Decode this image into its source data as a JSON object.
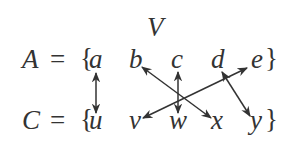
{
  "diagram": {
    "label_top": "V",
    "row_a": {
      "name": "A",
      "equals": "=",
      "open_brace": "{",
      "elements": [
        "a",
        "b",
        "c",
        "d",
        "e"
      ],
      "close_brace": "}"
    },
    "row_c": {
      "name": "C",
      "equals": "=",
      "open_brace": "{",
      "elements": [
        "u",
        "v",
        "w",
        "x",
        "y"
      ],
      "close_brace": "}"
    },
    "mappings": [
      {
        "from": "a",
        "to": "u",
        "type": "bidirectional"
      },
      {
        "from": "b",
        "to": "x",
        "type": "bidirectional"
      },
      {
        "from": "c",
        "to": "w",
        "type": "bidirectional"
      },
      {
        "from": "d",
        "to": "y",
        "type": "bidirectional"
      },
      {
        "from": "e",
        "to": "v",
        "type": "bidirectional"
      }
    ],
    "colors": {
      "ink": "#333333",
      "background": "#ffffff"
    }
  }
}
